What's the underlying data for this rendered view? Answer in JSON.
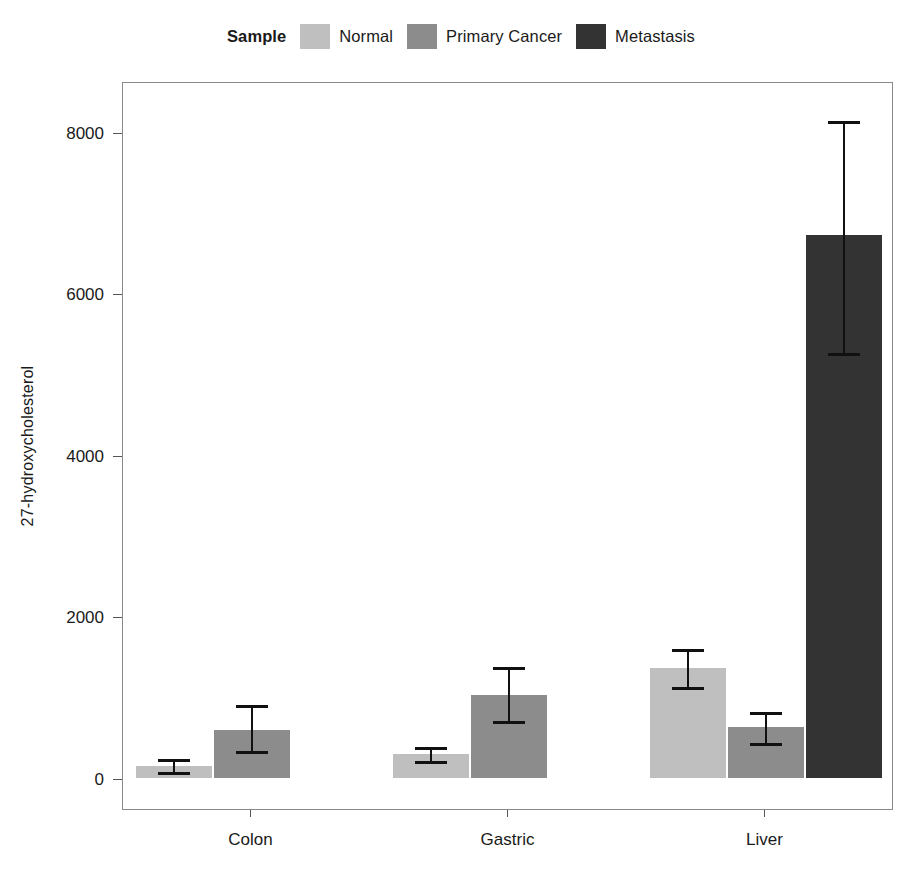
{
  "legend": {
    "title": "Sample",
    "items": [
      {
        "label": "Normal",
        "color": "#bfbfbf"
      },
      {
        "label": "Primary Cancer",
        "color": "#8c8c8c"
      },
      {
        "label": "Metastasis",
        "color": "#333333"
      }
    ]
  },
  "axes": {
    "ylabel": "27-hydroxycholesterol",
    "xlabel": "",
    "yticks": [
      "0",
      "2000",
      "4000",
      "6000",
      "8000"
    ],
    "xticks": [
      "Colon",
      "Gastric",
      "Liver"
    ]
  },
  "chart_data": {
    "type": "bar",
    "title": "",
    "xlabel": "",
    "ylabel": "27-hydroxycholesterol",
    "categories": [
      "Colon",
      "Gastric",
      "Liver"
    ],
    "ylim": [
      0,
      9000
    ],
    "ytick_values": [
      0,
      2000,
      4000,
      6000,
      8000
    ],
    "grid": false,
    "legend_position": "top-center",
    "legend_title": "Sample",
    "error_bars": true,
    "series": [
      {
        "name": "Normal",
        "color": "#bfbfbf",
        "values": [
          150,
          300,
          1360
        ],
        "err_low": [
          62,
          200,
          1115
        ],
        "err_high": [
          260,
          410,
          1620
        ]
      },
      {
        "name": "Primary Cancer",
        "color": "#8c8c8c",
        "values": [
          595,
          1030,
          630
        ],
        "err_low": [
          325,
          690,
          420
        ],
        "err_high": [
          930,
          1400,
          845
        ]
      },
      {
        "name": "Metastasis",
        "color": "#333333",
        "values": [
          null,
          null,
          6725
        ],
        "err_low": [
          null,
          null,
          5250
        ],
        "err_high": [
          null,
          null,
          8160
        ]
      }
    ]
  }
}
